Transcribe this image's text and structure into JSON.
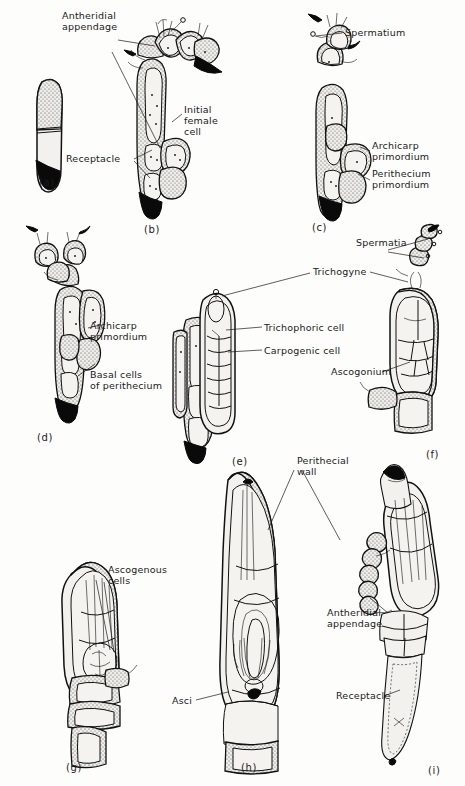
{
  "figure": {
    "background_color": "#fdfdfc",
    "ink_color": "#1a1a1a"
  },
  "panels": [
    {
      "id": "a",
      "letter": "(a)",
      "caption": ""
    },
    {
      "id": "b",
      "letter": "(b)",
      "caption": ""
    },
    {
      "id": "c",
      "letter": "(c)",
      "caption": ""
    },
    {
      "id": "d",
      "letter": "(d)",
      "caption": ""
    },
    {
      "id": "e",
      "letter": "(e)",
      "caption": ""
    },
    {
      "id": "f",
      "letter": "(f)",
      "caption": ""
    },
    {
      "id": "g",
      "letter": "(g)",
      "caption": ""
    },
    {
      "id": "h",
      "letter": "(h)",
      "caption": ""
    },
    {
      "id": "i",
      "letter": "(i)",
      "caption": ""
    }
  ],
  "labels": {
    "antheridial_appendage_b": "Antheridial\nappendage",
    "initial_female_cell": "Initial\nfemale\ncell",
    "receptacle_b": "Receptacle",
    "spermatium": "Spermatium",
    "archicarp_primordium_c": "Archicarp\nprimordium",
    "perithecium_primordium": "Perithecium\nprimordium",
    "archicarp_primordium_d": "Archicarp\nprimordium",
    "basal_cells_of_perithecium": "Basal cells\nof perithecium",
    "trichogyne": "Trichogyne",
    "trichophoric_cell": "Trichophoric cell",
    "carpogenic_cell": "Carpogenic cell",
    "spermatia": "Spermatia",
    "ascogonium": "Ascogonium",
    "ascogenous_cells": "Ascogenous\ncells",
    "perithecial_wall": "Perithecial\nwall",
    "asci": "Asci",
    "antheridial_appendage_i": "Antheridial\nappendage",
    "receptacle_i": "Receptacle"
  }
}
